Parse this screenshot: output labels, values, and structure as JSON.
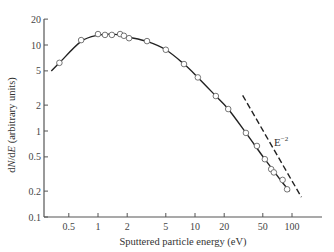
{
  "chart_data": {
    "type": "scatter",
    "title": "",
    "xlabel": "Sputtered particle energy (eV)",
    "ylabel": "dN/dE (arbitrary units)",
    "xscale": "log",
    "yscale": "log",
    "xlim": [
      0.3,
      200
    ],
    "ylim": [
      0.1,
      20
    ],
    "x_ticks": [
      0.5,
      1,
      2,
      5,
      10,
      20,
      50,
      100
    ],
    "x_tick_labels": [
      "0.5",
      "1",
      "2",
      "5",
      "10",
      "20",
      "50",
      "100"
    ],
    "y_ticks": [
      0.1,
      0.2,
      0.5,
      1,
      2,
      5,
      10,
      20
    ],
    "y_tick_labels": [
      "0.1",
      "0.2",
      "0.5",
      "1",
      "2",
      "5",
      "10",
      "20"
    ],
    "grid": false,
    "series": [
      {
        "name": "measured",
        "style": "open circles",
        "x": [
          0.4,
          0.67,
          1.0,
          1.18,
          1.39,
          1.69,
          1.85,
          2.09,
          3.2,
          5.0,
          7.7,
          10.7,
          16.4,
          22,
          33.5,
          43.5,
          52.5,
          61,
          65,
          80,
          89
        ],
        "y": [
          6.2,
          11.4,
          13.4,
          13.1,
          13.1,
          13.4,
          12.8,
          12.0,
          11.1,
          8.8,
          6.0,
          4.2,
          2.55,
          1.8,
          0.95,
          0.67,
          0.47,
          0.36,
          0.33,
          0.27,
          0.21
        ]
      },
      {
        "name": "fit",
        "style": "solid line",
        "x": [
          0.33,
          0.4,
          0.67,
          1.0,
          1.5,
          2.1,
          3.2,
          5.0,
          7.7,
          10.7,
          16.4,
          22,
          33.5,
          52.5,
          80,
          95
        ],
        "y": [
          5.0,
          6.2,
          11.0,
          13.0,
          13.3,
          12.3,
          11.0,
          8.8,
          6.0,
          4.2,
          2.55,
          1.8,
          0.95,
          0.47,
          0.25,
          0.2
        ]
      },
      {
        "name": "E^-2 reference",
        "style": "dashed line",
        "x": [
          31,
          125
        ],
        "y": [
          2.6,
          0.17
        ]
      }
    ],
    "annotations": [
      {
        "text": "E",
        "superscript": "−2",
        "x": 55,
        "y": 0.75
      }
    ]
  },
  "axes": {
    "xlabel": "Sputtered particle energy (eV)",
    "ylabel_prefix": "d",
    "ylabel_N": "N",
    "ylabel_slash": "/d",
    "ylabel_E": "E",
    "ylabel_suffix": " (arbitrary units)",
    "annotation_base": "E",
    "annotation_sup": "−2"
  }
}
